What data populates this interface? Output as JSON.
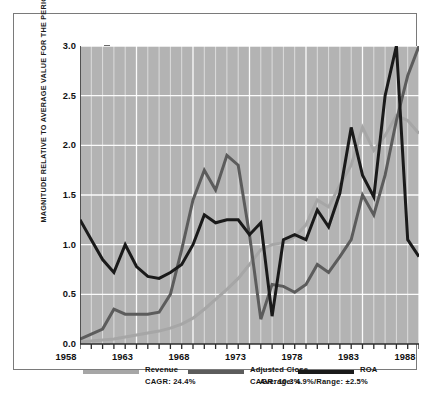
{
  "chart_data": {
    "type": "line",
    "title": "",
    "xlabel": "",
    "ylabel": "MAGNITUDE RELATIVE TO AVERAGE VALUE FOR THE PERIOD",
    "xlim": [
      1958,
      1988
    ],
    "ylim": [
      0.0,
      3.0
    ],
    "grid": true,
    "grid_color": "#ffffff",
    "plot_background": "#b3b3b3",
    "legend_position": "below-axis",
    "x_tick_labels": [
      "1958",
      "1963",
      "1968",
      "1973",
      "1978",
      "1983",
      "1988"
    ],
    "x_tick_values": [
      1958,
      1963,
      1968,
      1973,
      1978,
      1983,
      1988
    ],
    "x_minor_ticks_every": 1,
    "y_tick_labels": [
      "0.0",
      "0.5",
      "1.0",
      "1.5",
      "2.0",
      "2.5",
      "3.0"
    ],
    "y_tick_values": [
      0.0,
      0.5,
      1.0,
      1.5,
      2.0,
      2.5,
      3.0
    ],
    "x": [
      1958,
      1959,
      1960,
      1961,
      1962,
      1963,
      1964,
      1965,
      1966,
      1967,
      1968,
      1969,
      1970,
      1971,
      1972,
      1973,
      1974,
      1975,
      1976,
      1977,
      1978,
      1979,
      1980,
      1981,
      1982,
      1983,
      1984,
      1985,
      1986,
      1987,
      1988
    ],
    "series": [
      {
        "name": "Revenue",
        "color": "#a6a6a6",
        "annotation": "CAGR: 24.4%",
        "values": [
          0.02,
          0.03,
          0.04,
          0.05,
          0.07,
          0.09,
          0.11,
          0.13,
          0.16,
          0.2,
          0.26,
          0.35,
          0.45,
          0.55,
          0.66,
          0.8,
          0.95,
          1.0,
          1.02,
          1.08,
          1.2,
          1.45,
          1.38,
          1.6,
          1.8,
          2.18,
          1.95,
          2.1,
          2.3,
          2.25,
          2.12
        ]
      },
      {
        "name": "Adjusted Close",
        "color": "#5c5c5c",
        "annotation": "CAGR: 10.3%",
        "values": [
          0.05,
          0.1,
          0.15,
          0.35,
          0.3,
          0.3,
          0.3,
          0.32,
          0.5,
          0.95,
          1.45,
          1.75,
          1.55,
          1.9,
          1.8,
          1.1,
          0.25,
          0.6,
          0.58,
          0.52,
          0.6,
          0.8,
          0.72,
          0.88,
          1.05,
          1.5,
          1.3,
          1.7,
          2.25,
          2.7,
          3.0
        ]
      },
      {
        "name": "ROA",
        "color": "#1a1a1a",
        "annotation": "Average: 4.9%/Range: ±2.5%",
        "values": [
          1.25,
          1.05,
          0.85,
          0.72,
          1.0,
          0.78,
          0.68,
          0.66,
          0.72,
          0.8,
          1.0,
          1.3,
          1.22,
          1.25,
          1.25,
          1.1,
          1.22,
          0.28,
          1.05,
          1.1,
          1.05,
          1.35,
          1.18,
          1.52,
          2.18,
          1.7,
          1.48,
          2.5,
          3.0,
          1.05,
          0.88
        ]
      }
    ]
  },
  "legend": [
    {
      "label": "Revenue",
      "sub": "CAGR: 24.4%",
      "color": "#a6a6a6"
    },
    {
      "label": "Adjusted Close",
      "sub": "CAGR: 10.3%",
      "color": "#5c5c5c"
    },
    {
      "label": "ROA",
      "sub": "Average: 4.9%/Range: ±2.5%",
      "color": "#1a1a1a"
    }
  ]
}
